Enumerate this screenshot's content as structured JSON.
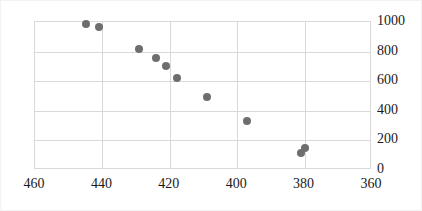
{
  "chart_data": {
    "type": "scatter",
    "title": "",
    "xlabel": "",
    "ylabel": "",
    "xlim": [
      460,
      360
    ],
    "ylim": [
      0,
      1000
    ],
    "x_reversed": true,
    "grid": true,
    "legend": "none",
    "marker_color": "#6e6e6e",
    "xticks": [
      460,
      440,
      420,
      400,
      380,
      360
    ],
    "yticks": [
      0,
      200,
      400,
      600,
      800,
      1000
    ],
    "xtick_labels": [
      "460",
      "440",
      "420",
      "400",
      "380",
      "360"
    ],
    "ytick_labels": [
      "0",
      "200",
      "400",
      "600",
      "800",
      "1000"
    ],
    "series": [
      {
        "name": "series-1",
        "points": [
          {
            "x": 445,
            "y": 985
          },
          {
            "x": 441,
            "y": 968
          },
          {
            "x": 429,
            "y": 815
          },
          {
            "x": 424,
            "y": 760
          },
          {
            "x": 421,
            "y": 700
          },
          {
            "x": 418,
            "y": 625
          },
          {
            "x": 409,
            "y": 490
          },
          {
            "x": 397,
            "y": 330
          },
          {
            "x": 381,
            "y": 112
          },
          {
            "x": 380,
            "y": 152
          }
        ]
      }
    ]
  }
}
